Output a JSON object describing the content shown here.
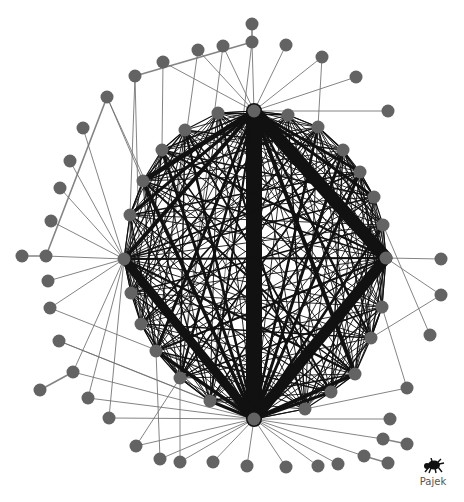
{
  "diagram": {
    "type": "network-graph",
    "software_label": "Pajek",
    "colors": {
      "background": "#ffffff",
      "node_fill": "#636363",
      "edge_thin": "#6e6e6e",
      "edge_core": "#111111",
      "logo_text": "#555555"
    },
    "node_radius": 6.5,
    "hubs": [
      {
        "id": "T",
        "x": 254,
        "y": 111
      },
      {
        "id": "B",
        "x": 254,
        "y": 419
      },
      {
        "id": "L",
        "x": 124,
        "y": 259
      },
      {
        "id": "R",
        "x": 386,
        "y": 258
      }
    ],
    "inner_ring": [
      {
        "id": "i1",
        "x": 288,
        "y": 115
      },
      {
        "id": "i2",
        "x": 318,
        "y": 127
      },
      {
        "id": "i3",
        "x": 343,
        "y": 150
      },
      {
        "id": "i4",
        "x": 360,
        "y": 172
      },
      {
        "id": "i5",
        "x": 374,
        "y": 197
      },
      {
        "id": "i6",
        "x": 383,
        "y": 225
      },
      {
        "id": "i7",
        "x": 382,
        "y": 307
      },
      {
        "id": "i8",
        "x": 371,
        "y": 338
      },
      {
        "id": "i9",
        "x": 355,
        "y": 374
      },
      {
        "id": "i10",
        "x": 331,
        "y": 392
      },
      {
        "id": "i11",
        "x": 305,
        "y": 409
      },
      {
        "id": "i12",
        "x": 210,
        "y": 401
      },
      {
        "id": "i13",
        "x": 180,
        "y": 378
      },
      {
        "id": "i14",
        "x": 156,
        "y": 351
      },
      {
        "id": "i15",
        "x": 141,
        "y": 324
      },
      {
        "id": "i16",
        "x": 131,
        "y": 293
      },
      {
        "id": "i17",
        "x": 130,
        "y": 215
      },
      {
        "id": "i18",
        "x": 143,
        "y": 181
      },
      {
        "id": "i19",
        "x": 162,
        "y": 150
      },
      {
        "id": "i20",
        "x": 185,
        "y": 130
      },
      {
        "id": "i21",
        "x": 218,
        "y": 113
      }
    ],
    "outer_nodes": [
      {
        "id": "o1",
        "x": 252,
        "y": 24,
        "to": [
          "o2"
        ]
      },
      {
        "id": "o2",
        "x": 252,
        "y": 42,
        "to": [
          "T",
          "o6",
          "i12"
        ]
      },
      {
        "id": "o3",
        "x": 223,
        "y": 46,
        "to": [
          "T",
          "i13"
        ]
      },
      {
        "id": "o4",
        "x": 198,
        "y": 50,
        "to": [
          "T",
          "i14"
        ]
      },
      {
        "id": "o5",
        "x": 163,
        "y": 62,
        "to": [
          "T",
          "i19"
        ]
      },
      {
        "id": "o6",
        "x": 135,
        "y": 76,
        "to": [
          "i17",
          "i15"
        ]
      },
      {
        "id": "o7",
        "x": 107,
        "y": 97,
        "to": [
          "i18",
          "B"
        ]
      },
      {
        "id": "o8",
        "x": 83,
        "y": 128,
        "to": [
          "L"
        ]
      },
      {
        "id": "o9",
        "x": 70,
        "y": 161,
        "to": [
          "L"
        ]
      },
      {
        "id": "o10",
        "x": 60,
        "y": 188,
        "to": [
          "L"
        ]
      },
      {
        "id": "o11",
        "x": 51,
        "y": 221,
        "to": [
          "L"
        ]
      },
      {
        "id": "o12",
        "x": 46,
        "y": 256,
        "to": [
          "L",
          "o7",
          "o13"
        ]
      },
      {
        "id": "o13",
        "x": 22,
        "y": 256,
        "to": []
      },
      {
        "id": "o14",
        "x": 48,
        "y": 281,
        "to": [
          "L"
        ]
      },
      {
        "id": "o15",
        "x": 50,
        "y": 308,
        "to": [
          "L",
          "i11"
        ]
      },
      {
        "id": "o16",
        "x": 59,
        "y": 341,
        "to": [
          "i12",
          "B"
        ]
      },
      {
        "id": "o17",
        "x": 73,
        "y": 372,
        "to": [
          "L",
          "B",
          "o18"
        ]
      },
      {
        "id": "o18",
        "x": 40,
        "y": 390,
        "to": []
      },
      {
        "id": "o19",
        "x": 88,
        "y": 398,
        "to": [
          "L",
          "B"
        ]
      },
      {
        "id": "o20",
        "x": 109,
        "y": 418,
        "to": [
          "L",
          "B"
        ]
      },
      {
        "id": "o21",
        "x": 136,
        "y": 446,
        "to": [
          "B",
          "i13"
        ]
      },
      {
        "id": "o22",
        "x": 160,
        "y": 459,
        "to": [
          "B",
          "i14"
        ]
      },
      {
        "id": "o23",
        "x": 180,
        "y": 462,
        "to": [
          "B",
          "i13"
        ]
      },
      {
        "id": "o24",
        "x": 213,
        "y": 462,
        "to": [
          "B"
        ]
      },
      {
        "id": "o25",
        "x": 247,
        "y": 466,
        "to": [
          "B"
        ]
      },
      {
        "id": "o26",
        "x": 286,
        "y": 467,
        "to": [
          "B"
        ]
      },
      {
        "id": "o27",
        "x": 318,
        "y": 466,
        "to": [
          "B"
        ]
      },
      {
        "id": "o28",
        "x": 338,
        "y": 464,
        "to": [
          "B"
        ]
      },
      {
        "id": "o29",
        "x": 364,
        "y": 456,
        "to": [
          "B",
          "o30"
        ]
      },
      {
        "id": "o30",
        "x": 388,
        "y": 463,
        "to": []
      },
      {
        "id": "o31",
        "x": 383,
        "y": 439,
        "to": [
          "B",
          "o32"
        ]
      },
      {
        "id": "o32",
        "x": 407,
        "y": 444,
        "to": []
      },
      {
        "id": "o33",
        "x": 390,
        "y": 419,
        "to": [
          "B"
        ]
      },
      {
        "id": "o34",
        "x": 407,
        "y": 388,
        "to": [
          "i11",
          "i7"
        ]
      },
      {
        "id": "o35",
        "x": 430,
        "y": 335,
        "to": [
          "i6"
        ]
      },
      {
        "id": "o36",
        "x": 441,
        "y": 295,
        "to": [
          "i8",
          "R"
        ]
      },
      {
        "id": "o37",
        "x": 441,
        "y": 259,
        "to": [
          "R"
        ]
      },
      {
        "id": "o38",
        "x": 388,
        "y": 111,
        "to": [
          "T"
        ]
      },
      {
        "id": "o39",
        "x": 356,
        "y": 77,
        "to": [
          "T"
        ]
      },
      {
        "id": "o40",
        "x": 322,
        "y": 57,
        "to": [
          "T",
          "i2"
        ]
      },
      {
        "id": "o41",
        "x": 286,
        "y": 45,
        "to": [
          "T"
        ]
      }
    ],
    "core_edges": [
      {
        "a": "T",
        "b": "B",
        "w": 16
      },
      {
        "a": "T",
        "b": "R",
        "w": 13
      },
      {
        "a": "R",
        "b": "B",
        "w": 11
      },
      {
        "a": "L",
        "b": "B",
        "w": 9
      },
      {
        "a": "L",
        "b": "T",
        "w": 4
      },
      {
        "a": "L",
        "b": "R",
        "w": 2
      },
      {
        "a": "T",
        "b": "i18",
        "w": 5
      },
      {
        "a": "T",
        "b": "i17",
        "w": 3
      },
      {
        "a": "T",
        "b": "i9",
        "w": 4
      },
      {
        "a": "T",
        "b": "i8",
        "w": 2.5
      },
      {
        "a": "T",
        "b": "i5",
        "w": 3
      },
      {
        "a": "T",
        "b": "i4",
        "w": 3
      },
      {
        "a": "T",
        "b": "i14",
        "w": 3
      },
      {
        "a": "T",
        "b": "i13",
        "w": 2.5
      },
      {
        "a": "T",
        "b": "i12",
        "w": 2
      },
      {
        "a": "B",
        "b": "i18",
        "w": 3.5
      },
      {
        "a": "B",
        "b": "i19",
        "w": 3
      },
      {
        "a": "B",
        "b": "i20",
        "w": 2.5
      },
      {
        "a": "B",
        "b": "i3",
        "w": 3
      },
      {
        "a": "B",
        "b": "i2",
        "w": 2.5
      },
      {
        "a": "B",
        "b": "i4",
        "w": 3
      },
      {
        "a": "B",
        "b": "i6",
        "w": 2.5
      },
      {
        "a": "B",
        "b": "i9",
        "w": 4
      },
      {
        "a": "B",
        "b": "i14",
        "w": 3.5
      },
      {
        "a": "B",
        "b": "i12",
        "w": 3
      },
      {
        "a": "B",
        "b": "i10",
        "w": 3
      },
      {
        "a": "L",
        "b": "i9",
        "w": 2.5
      },
      {
        "a": "L",
        "b": "i4",
        "w": 1.5
      },
      {
        "a": "R",
        "b": "i19",
        "w": 2
      },
      {
        "a": "R",
        "b": "i14",
        "w": 2
      },
      {
        "a": "i18",
        "b": "i9",
        "w": 2
      },
      {
        "a": "i2",
        "b": "i15",
        "w": 1.8
      },
      {
        "a": "i3",
        "b": "i13",
        "w": 1.8
      },
      {
        "a": "i21",
        "b": "i11",
        "w": 1.8
      },
      {
        "a": "i20",
        "b": "i10",
        "w": 1.8
      }
    ]
  }
}
